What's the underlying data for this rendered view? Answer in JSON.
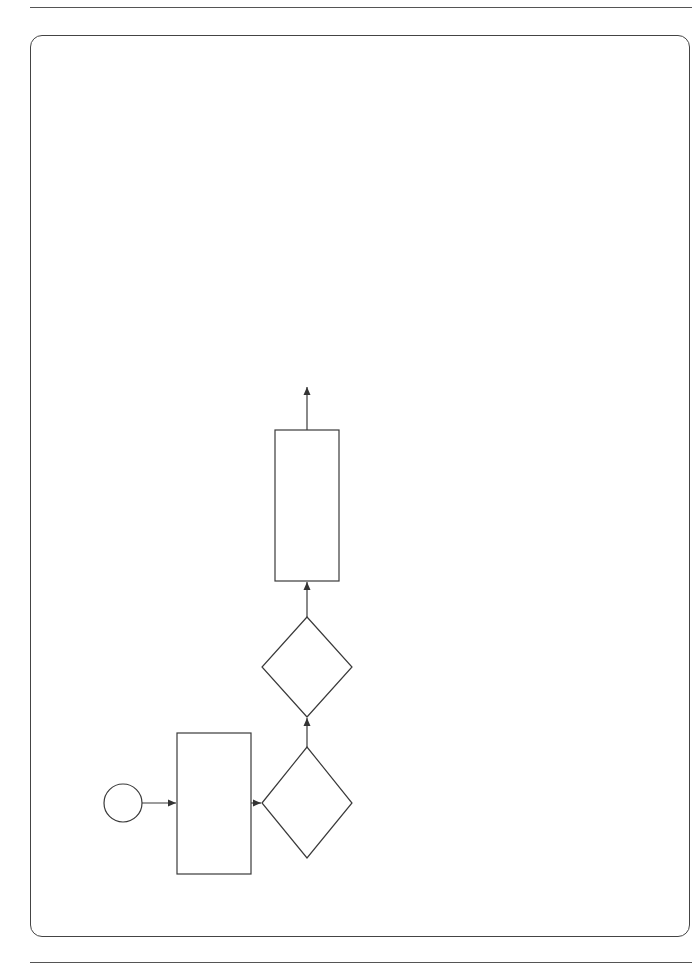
{
  "connectors": {
    "b": {
      "letter": "B",
      "sheet": "Sheet 2"
    },
    "c": {
      "letter": "C",
      "sheet": "Sheet 2"
    }
  },
  "boxes": {
    "defects_certificate": {
      "ref": "11.2(4)",
      "line1": "The Defects Certificate is either",
      "line2": "a list of notified Defects which",
      "line3": "the C has not corrected by the",
      "line4_italic": "defects date",
      "line4_rest": " or a statement that",
      "line5": "there are no such Defects"
    },
    "halved": {
      "ref": "50.6",
      "line1": "The amount retained is",
      "line2": "halved in the first",
      "line3": "assessment made after",
      "line4": "Completion"
    },
    "half_retention": {
      "line1": "Amount retained",
      "line2_pre": "is half the ",
      "line2_italic": "retention"
    },
    "remains": {
      "ref": "50.6",
      "line1": "The amount retained",
      "line2": "remains at this amount",
      "line3_pre": "until the ",
      "line3_italic": "assessment day",
      "line4": "after the Defects",
      "line5": "Certificate is issued"
    },
    "no_amount": {
      "ref": "50.6",
      "line1": "No amount is retained in the",
      "line2": "assessment made after the",
      "line3": "Defects Certificate has",
      "line4": "been issued"
    },
    "payment": {
      "line1": "FC 51",
      "line2": "Payment"
    },
    "finish": {
      "label": "Finish"
    }
  },
  "decisions": {
    "issued": {
      "line1": "Has",
      "line2": "the Defects",
      "line3": "Certificate been",
      "line4": "issued?",
      "no": "NO",
      "yes": "YES"
    },
    "first_assessment": {
      "line1": "Is it the first",
      "line2": "assessment after",
      "line3": "Completion?",
      "no": "NO",
      "yes": "YES"
    }
  },
  "section_labels": {
    "after_completion": "AFTER COMPLETION",
    "after_defects_1": "AFTER THE DEFECTS",
    "after_defects_2": "CERTIFICATE IS ISSUED"
  },
  "caption": {
    "line1": "Flow chart 50 Sheet 3 of 3",
    "line2": "Assessing the amount due"
  },
  "colors": {
    "line": "#333333",
    "background": "#ffffff"
  }
}
